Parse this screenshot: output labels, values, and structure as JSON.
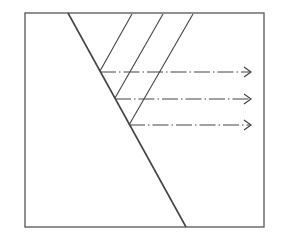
{
  "diagram": {
    "type": "refraction-schematic",
    "colors": {
      "background": "#ffffff",
      "line": "#444444",
      "frame": "#555555"
    },
    "frame": {
      "x": 25,
      "y": 13,
      "width": 239,
      "height": 214
    },
    "main_line": {
      "x1": 68,
      "y1": 13,
      "x2": 186,
      "y2": 227
    },
    "incident_rays": [
      {
        "x1": 132,
        "y1": 14,
        "x2": 100,
        "y2": 71
      },
      {
        "x1": 163,
        "y1": 14,
        "x2": 115,
        "y2": 98
      },
      {
        "x1": 193,
        "y1": 14,
        "x2": 129,
        "y2": 125
      }
    ],
    "emergent_rays": [
      {
        "x1": 100,
        "y1": 72,
        "x2": 251,
        "y2": 72,
        "style": "dash-dot",
        "arrow": true
      },
      {
        "x1": 115,
        "y1": 99,
        "x2": 251,
        "y2": 99,
        "style": "dash-dot",
        "arrow": true
      },
      {
        "x1": 129,
        "y1": 125,
        "x2": 251,
        "y2": 125,
        "style": "dash-dot",
        "arrow": true
      }
    ]
  }
}
